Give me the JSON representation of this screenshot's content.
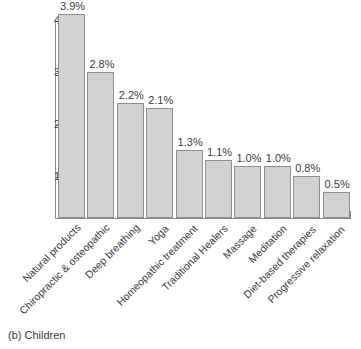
{
  "caption": "(b) Children",
  "chart_data": {
    "type": "bar",
    "title": "(b) Children",
    "xlabel": "",
    "ylabel": "",
    "ylim": [
      0,
      4.2
    ],
    "grid": false,
    "legend": null,
    "ytick_labels": [
      "4",
      "3",
      "2",
      "1"
    ],
    "ytick_values": [
      4,
      3,
      2,
      1
    ],
    "categories": [
      "Natural products",
      "Chiropractic & osteopathic",
      "Deep breathing",
      "Yoga",
      "Homeopathic treatment",
      "Traditional Healers",
      "Massage",
      "Meditation",
      "Diet-based therapies",
      "Progressive relaxation"
    ],
    "values": [
      3.9,
      2.8,
      2.2,
      2.1,
      1.3,
      1.1,
      1.0,
      1.0,
      0.8,
      0.5
    ],
    "value_labels": [
      "3.9%",
      "2.8%",
      "2.2%",
      "2.1%",
      "1.3%",
      "1.1%",
      "1.0%",
      "1.0%",
      "0.8%",
      "0.5%"
    ],
    "bar_fill_color": "#d2d2d2",
    "bar_edge_color": "#8f8f8f",
    "axis_color": "#8c8c8c",
    "text_color": "#3c3c3c"
  }
}
